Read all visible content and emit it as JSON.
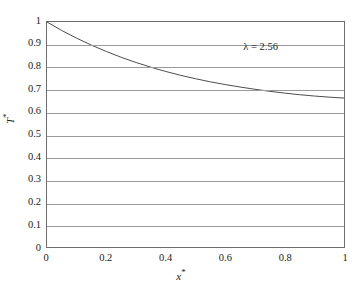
{
  "chart_data": {
    "type": "line",
    "title": "",
    "subtitle": "",
    "xlabel": "x*",
    "ylabel": "T*",
    "xlim": [
      0,
      1
    ],
    "ylim": [
      0,
      1
    ],
    "grid": "horizontal",
    "legend": "none",
    "x_ticks": [
      "0",
      "0.2",
      "0.4",
      "0.6",
      "0.8",
      "1"
    ],
    "x_tick_values": [
      0,
      0.2,
      0.4,
      0.6,
      0.8,
      1
    ],
    "y_ticks": [
      "0",
      "0.1",
      "0.2",
      "0.3",
      "0.4",
      "0.5",
      "0.6",
      "0.7",
      "0.8",
      "0.9",
      "1"
    ],
    "y_tick_values": [
      0,
      0.1,
      0.2,
      0.3,
      0.4,
      0.5,
      0.6,
      0.7,
      0.8,
      0.9,
      1
    ],
    "series": [
      {
        "name": "T*(x*)",
        "color": "#4d4d4d",
        "x": [
          0,
          0.05,
          0.1,
          0.15,
          0.2,
          0.25,
          0.3,
          0.35,
          0.4,
          0.45,
          0.5,
          0.55,
          0.6,
          0.65,
          0.7,
          0.75,
          0.8,
          0.85,
          0.9,
          0.95,
          1
        ],
        "values": [
          1.0,
          0.962,
          0.928,
          0.897,
          0.869,
          0.843,
          0.82,
          0.799,
          0.78,
          0.763,
          0.748,
          0.734,
          0.722,
          0.711,
          0.701,
          0.692,
          0.684,
          0.677,
          0.671,
          0.666,
          0.662
        ]
      }
    ],
    "annotations": [
      {
        "text": "λ = 2.56",
        "x": 0.66,
        "y": 0.885
      }
    ],
    "axis_color": "#6e6e6e",
    "grid_color": "#9a9a9a",
    "background": "#ffffff"
  }
}
